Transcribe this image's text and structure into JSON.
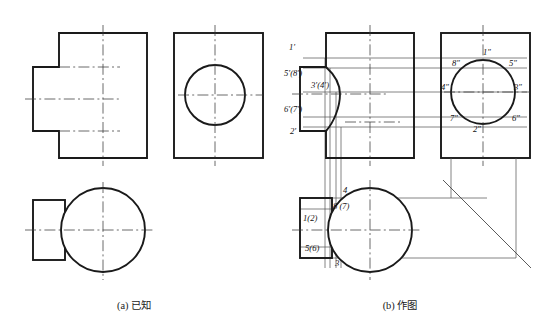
{
  "figure": {
    "title_a": "(a) 已知",
    "title_b": "(b) 作图",
    "caption_a_x": 134,
    "caption_a_y": 306,
    "caption_b_x": 400,
    "caption_b_y": 306
  },
  "panel_a": {
    "name": "given-views",
    "views": [
      {
        "name": "front-view",
        "kind": "stepped-block"
      },
      {
        "name": "side-view",
        "kind": "rect-with-circle"
      },
      {
        "name": "bottom-view",
        "kind": "circle-with-rect"
      }
    ]
  },
  "panel_b": {
    "name": "construction-views",
    "views": [
      {
        "name": "front-view",
        "kind": "stepped-block-with-intersection-curve"
      },
      {
        "name": "side-view",
        "kind": "rect-with-circle-labeled"
      },
      {
        "name": "bottom-view",
        "kind": "circle-with-rect-labeled"
      }
    ],
    "miter_line": {
      "name": "45-degree-miter-line",
      "angle": "45"
    }
  },
  "labels": {
    "front": [
      {
        "id": "front-label-1",
        "text": "1′",
        "x": 289,
        "y": 50
      },
      {
        "id": "front-label-58",
        "text": "5′(8′)",
        "x": 284,
        "y": 76
      },
      {
        "id": "front-label-34",
        "text": "3′(4′)",
        "x": 311,
        "y": 88
      },
      {
        "id": "front-label-67",
        "text": "6′(7′)",
        "x": 284,
        "y": 112
      },
      {
        "id": "front-label-2",
        "text": "2′",
        "x": 290,
        "y": 134
      }
    ],
    "side": [
      {
        "id": "side-label-1",
        "text": "1″",
        "x": 483,
        "y": 55
      },
      {
        "id": "side-label-8",
        "text": "8″",
        "x": 452,
        "y": 66
      },
      {
        "id": "side-label-5",
        "text": "5″",
        "x": 509,
        "y": 66
      },
      {
        "id": "side-label-4",
        "text": "4″",
        "x": 441,
        "y": 90
      },
      {
        "id": "side-label-3",
        "text": "3″",
        "x": 514,
        "y": 90
      },
      {
        "id": "side-label-7",
        "text": "7″",
        "x": 450,
        "y": 121
      },
      {
        "id": "side-label-6",
        "text": "6″",
        "x": 512,
        "y": 121
      },
      {
        "id": "side-label-2",
        "text": "2″",
        "x": 473,
        "y": 132
      }
    ],
    "bottom": [
      {
        "id": "bottom-label-4",
        "text": "4",
        "x": 343,
        "y": 193
      },
      {
        "id": "bottom-label-87",
        "text": "8 (7)",
        "x": 333,
        "y": 209
      },
      {
        "id": "bottom-label-12",
        "text": "1(2)",
        "x": 303,
        "y": 221
      },
      {
        "id": "bottom-label-56",
        "text": "5(6)",
        "x": 305,
        "y": 251
      },
      {
        "id": "bottom-label-3",
        "text": "3",
        "x": 335,
        "y": 266
      }
    ]
  },
  "colors": {
    "outline": "#1a1a1a",
    "centerline": "#3a3a3a",
    "projection": "#545454",
    "background": "#ffffff"
  }
}
